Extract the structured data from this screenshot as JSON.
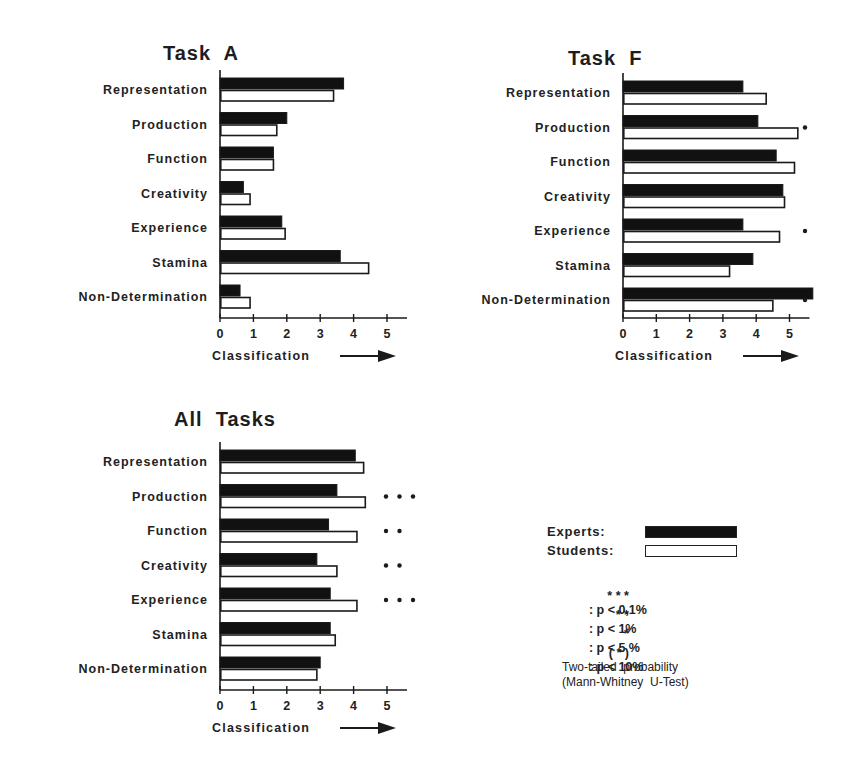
{
  "chart_data": [
    {
      "type": "bar",
      "orientation": "horizontal",
      "title": "Task A",
      "xlabel": "Classification",
      "ylabel": "",
      "xlim": [
        0,
        5.6
      ],
      "xticks": [
        0,
        1,
        2,
        3,
        4,
        5
      ],
      "categories": [
        "Representation",
        "Production",
        "Function",
        "Creativity",
        "Experience",
        "Stamina",
        "Non-Determination"
      ],
      "series": [
        {
          "name": "Experts",
          "values": [
            3.7,
            2.0,
            1.6,
            0.7,
            1.85,
            3.6,
            0.6
          ]
        },
        {
          "name": "Students",
          "values": [
            3.4,
            1.7,
            1.6,
            0.9,
            1.95,
            4.45,
            0.9
          ]
        }
      ],
      "significance": [
        "",
        "",
        "",
        "",
        "",
        "",
        ""
      ],
      "grid": false
    },
    {
      "type": "bar",
      "orientation": "horizontal",
      "title": "Task F",
      "xlabel": "Classification",
      "ylabel": "",
      "xlim": [
        0,
        5.6
      ],
      "xticks": [
        0,
        1,
        2,
        3,
        4,
        5
      ],
      "categories": [
        "Representation",
        "Production",
        "Function",
        "Creativity",
        "Experience",
        "Stamina",
        "Non-Determination"
      ],
      "series": [
        {
          "name": "Experts",
          "values": [
            3.6,
            4.05,
            4.6,
            4.8,
            3.6,
            3.9,
            5.7
          ]
        },
        {
          "name": "Students",
          "values": [
            4.3,
            5.25,
            5.15,
            4.85,
            4.7,
            3.2,
            4.5
          ]
        }
      ],
      "significance": [
        "",
        "*",
        "",
        "",
        "*",
        "",
        "*"
      ],
      "grid": false
    },
    {
      "type": "bar",
      "orientation": "horizontal",
      "title": "All Tasks",
      "xlabel": "Classification",
      "ylabel": "",
      "xlim": [
        0,
        5.6
      ],
      "xticks": [
        0,
        1,
        2,
        3,
        4,
        5
      ],
      "categories": [
        "Representation",
        "Production",
        "Function",
        "Creativity",
        "Experience",
        "Stamina",
        "Non-Determination"
      ],
      "series": [
        {
          "name": "Experts",
          "values": [
            4.05,
            3.5,
            3.25,
            2.9,
            3.3,
            3.3,
            3.0
          ]
        },
        {
          "name": "Students",
          "values": [
            4.3,
            4.35,
            4.1,
            3.5,
            4.1,
            3.45,
            2.9
          ]
        }
      ],
      "significance": [
        "",
        "* * *",
        "* *",
        "* *",
        "* * *",
        "",
        ""
      ],
      "grid": false
    }
  ],
  "panels": {
    "task_a": {
      "title": "Task  A",
      "xlabel": "Classification"
    },
    "task_f": {
      "title": "Task  F",
      "xlabel": "Classification"
    },
    "all_tasks": {
      "title": "All  Tasks",
      "xlabel": "Classification"
    }
  },
  "legend": {
    "experts_label": "Experts:",
    "students_label": "Students:",
    "experts_color": "#111111",
    "students_color": "#ffffff",
    "significance_levels": [
      {
        "marker": "* * *",
        "text": ": p < 0,1%"
      },
      {
        "marker": "* *",
        "text": ": p < 1%"
      },
      {
        "marker": "*",
        "text": ": p < 5 %"
      },
      {
        "marker": "( * )",
        "text": ": p < 10%"
      }
    ],
    "note_line1": "Two-tailed  probability",
    "note_line2": "(Mann-Whitney  U-Test)"
  }
}
